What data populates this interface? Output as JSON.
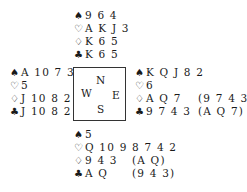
{
  "suits": {
    "spades": "♠",
    "hearts": "♡",
    "diamonds": "♢",
    "clubs": "♣"
  },
  "compass": {
    "north": "N",
    "west": "W",
    "east": "E",
    "south": "S"
  },
  "hands": {
    "north": {
      "spades": "9 6 4",
      "hearts": "A K J 3",
      "diamonds": "K 6 5",
      "clubs": "K 6 5"
    },
    "west": {
      "spades": "A 10 7 3",
      "hearts": "5",
      "diamonds": "J 10 8 2",
      "clubs": "J 10 8 2"
    },
    "east": {
      "spades": "K Q J 8 2",
      "hearts": "6",
      "diamonds": "A Q 7",
      "diamonds_alt": "(9 7 4 3)",
      "clubs": "9 7 4 3",
      "clubs_alt": "(A Q 7)"
    },
    "south": {
      "spades": "5",
      "hearts": "Q 10 9 8 7 4 2",
      "diamonds": "9 4 3",
      "diamonds_alt": "(A Q)",
      "clubs": "A Q",
      "clubs_alt": "(9 4 3)"
    }
  }
}
